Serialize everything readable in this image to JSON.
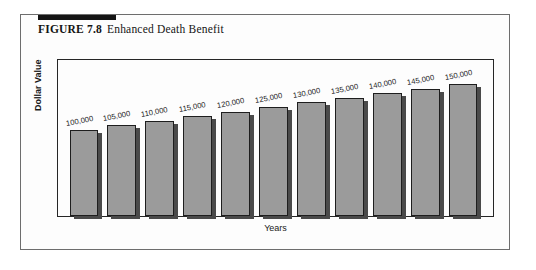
{
  "figure": {
    "number": "FIGURE 7.8",
    "caption": "Enhanced Death Benefit"
  },
  "chart_data": {
    "type": "bar",
    "title": "Enhanced Death Benefit",
    "xlabel": "Years",
    "ylabel": "Dollar Value",
    "grid": false,
    "legend": "none",
    "ylim": [
      0,
      160000
    ],
    "categories": [
      "1",
      "2",
      "3",
      "4",
      "5",
      "6",
      "7",
      "8",
      "9",
      "10",
      "11"
    ],
    "values": [
      100000,
      105000,
      110000,
      115000,
      120000,
      125000,
      130000,
      135000,
      140000,
      145000,
      150000
    ],
    "data_labels": [
      "100,000",
      "105,000",
      "110,000",
      "115,000",
      "120,000",
      "125,000",
      "130,000",
      "135,000",
      "140,000",
      "145,000",
      "150,000"
    ],
    "bar_color": "#9b9b9b",
    "bar_border_color": "#1e1e1e",
    "bar_shadow_color": "#4a4a4a"
  }
}
